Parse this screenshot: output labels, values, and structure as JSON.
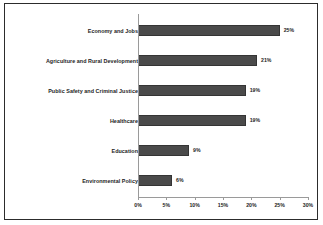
{
  "chart_data": {
    "type": "bar",
    "orientation": "horizontal",
    "title": "",
    "xlabel": "",
    "ylabel": "",
    "categories": [
      "Economy and Jobs",
      "Agriculture and Rural Development",
      "Public Safety and Criminal Justice",
      "Healthcare",
      "Education",
      "Environmental Policy"
    ],
    "values": [
      25,
      21,
      19,
      19,
      9,
      6
    ],
    "value_labels": [
      "25%",
      "21%",
      "19%",
      "19%",
      "9%",
      "6%"
    ],
    "xlim": [
      0,
      30
    ],
    "xticks": [
      0,
      5,
      10,
      15,
      20,
      25,
      30
    ],
    "xtick_labels": [
      "0%",
      "5%",
      "10%",
      "15%",
      "20%",
      "25%",
      "30%"
    ],
    "grid": false,
    "legend": false,
    "bar_color": "#4a4a4a",
    "bar_border_color": "#343434",
    "axis_color": "#9a9a9a",
    "text_color": "#1d1d1d",
    "frame_color": "#2c2c2c",
    "background": "#ffffff"
  }
}
